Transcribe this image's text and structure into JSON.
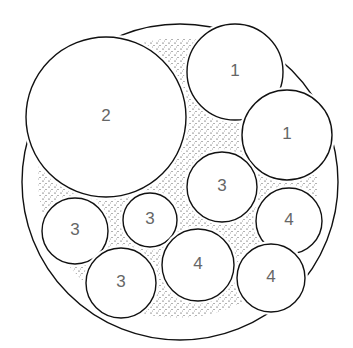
{
  "diagram": {
    "type": "packed-circles",
    "outer_ring": {
      "cx": 180,
      "cy": 182,
      "r": 158
    },
    "fill_region": {
      "cx": 178,
      "cy": 178,
      "r": 140,
      "pattern": "stipple"
    },
    "circles": [
      {
        "id": "c2",
        "label": "2",
        "cx": 106,
        "cy": 117,
        "r": 80
      },
      {
        "id": "c1a",
        "label": "1",
        "cx": 235,
        "cy": 72,
        "r": 48
      },
      {
        "id": "c1b",
        "label": "1",
        "cx": 287,
        "cy": 135,
        "r": 45
      },
      {
        "id": "c3a",
        "label": "3",
        "cx": 222,
        "cy": 187,
        "r": 35
      },
      {
        "id": "c3b",
        "label": "3",
        "cx": 150,
        "cy": 220,
        "r": 27
      },
      {
        "id": "c3c",
        "label": "3",
        "cx": 75,
        "cy": 231,
        "r": 33
      },
      {
        "id": "c3d",
        "label": "3",
        "cx": 121,
        "cy": 283,
        "r": 35
      },
      {
        "id": "c4a",
        "label": "4",
        "cx": 198,
        "cy": 265,
        "r": 36
      },
      {
        "id": "c4b",
        "label": "4",
        "cx": 289,
        "cy": 221,
        "r": 33
      },
      {
        "id": "c4c",
        "label": "4",
        "cx": 271,
        "cy": 278,
        "r": 34
      }
    ]
  }
}
